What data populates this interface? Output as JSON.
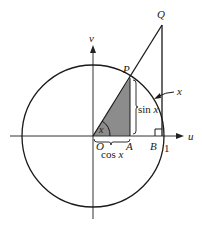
{
  "diagram": {
    "type": "unit-circle-trig",
    "labels": {
      "u_axis": "u",
      "v_axis": "v",
      "origin": "O",
      "point_p": "P",
      "point_q": "Q",
      "point_a": "A",
      "point_b": "B",
      "one": "1",
      "angle": "x",
      "arc": "x",
      "sin": "sin x",
      "cos": "cos x"
    },
    "colors": {
      "stroke": "#1a1a1a",
      "shaded_triangle": "#8c8c8c",
      "axis": "#333333",
      "background": "#ffffff"
    }
  }
}
